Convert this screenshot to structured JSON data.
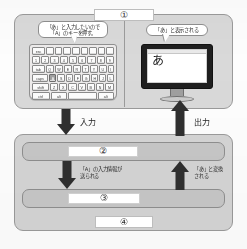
{
  "diagram": {
    "colors": {
      "panel_fill": "#d7d7d7",
      "panel_border": "#9a9a9a",
      "bar_fill": "#c6c6c6",
      "arrow": "#2f2f2f",
      "plaque_fill": "#ffffff",
      "page_background": "#fdfdfd"
    },
    "steps": [
      {
        "id": "step-1",
        "marker": "①"
      },
      {
        "id": "step-2",
        "marker": "②"
      },
      {
        "id": "step-3",
        "marker": "③"
      },
      {
        "id": "step-4",
        "marker": "④"
      }
    ],
    "balloons": {
      "keyboard": {
        "line1": "「あ」と入力したいので",
        "line2": "「A」のキーを押す。"
      },
      "monitor": {
        "line1": "「あ」と表示される"
      }
    },
    "monitor": {
      "screen_text": "あ"
    },
    "keyboard": {
      "highlight_key": "A",
      "rows": [
        {
          "keys": [
            "esc",
            "",
            "",
            "",
            "",
            "",
            "",
            "",
            "",
            ""
          ]
        },
        {
          "keys": [
            "1",
            "2",
            "3",
            "4",
            "5",
            "6",
            "7",
            "8",
            "9"
          ]
        },
        {
          "keys": [
            "tab",
            "Q",
            "W",
            "E",
            "R",
            "T",
            "Y",
            "U",
            "I"
          ]
        },
        {
          "keys": [
            "caps",
            "A",
            "S",
            "D",
            "F",
            "G",
            "H",
            "J",
            "L"
          ]
        },
        {
          "keys": [
            "shift",
            "Z",
            "X",
            "C",
            "V",
            "B",
            "N",
            "M"
          ]
        },
        {
          "keys": [
            "ctrl",
            "alt",
            "space",
            "alt"
          ]
        }
      ]
    },
    "flow_labels": {
      "input": "入力",
      "output": "出力",
      "send": {
        "line1": "「A」の入力情報が",
        "line2": "送られる"
      },
      "convert": {
        "line1": "「あ」と変換",
        "line2": "される"
      }
    }
  }
}
